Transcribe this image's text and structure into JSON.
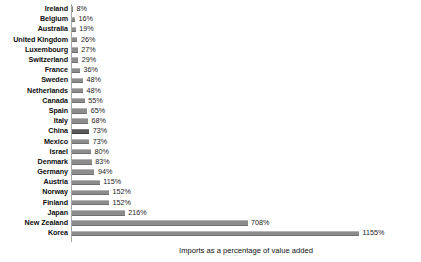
{
  "chart_data": {
    "type": "bar",
    "orientation": "horizontal",
    "title": "",
    "xlabel": "Imports as a percentage of value added",
    "ylabel": "",
    "xlim": [
      0,
      1155
    ],
    "grid": false,
    "legend": false,
    "value_suffix": "%",
    "colors": {
      "bar": "#8c8c8c",
      "highlight_bar": "#595959",
      "axis": "#a6a6a6",
      "text": "#1a1a1a"
    },
    "highlight_category": "China",
    "categories": [
      "Ireland",
      "Belgium",
      "Australia",
      "United Kingdom",
      "Luxembourg",
      "Switzerland",
      "France",
      "Sweden",
      "Netherlands",
      "Canada",
      "Spain",
      "Italy",
      "China",
      "Mexico",
      "Israel",
      "Denmark",
      "Germany",
      "Austria",
      "Norway",
      "Finland",
      "Japan",
      "New Zealand",
      "Korea"
    ],
    "values": [
      8,
      16,
      19,
      26,
      27,
      29,
      36,
      48,
      48,
      55,
      65,
      68,
      73,
      73,
      80,
      83,
      94,
      115,
      152,
      152,
      216,
      708,
      1155
    ],
    "value_labels": [
      "8%",
      "16%",
      "19%",
      "26%",
      "27%",
      "29%",
      "36%",
      "48%",
      "48%",
      "55%",
      "65%",
      "68%",
      "73%",
      "73%",
      "80%",
      "83%",
      "94%",
      "115%",
      "152%",
      "152%",
      "216%",
      "708%",
      "1155%"
    ]
  }
}
